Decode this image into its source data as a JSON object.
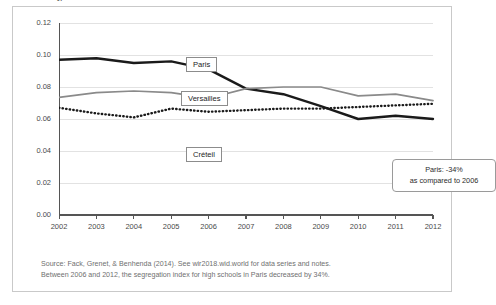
{
  "chart_data": {
    "type": "line",
    "title": "",
    "xlabel": "",
    "ylabel": "Segregation index in high schools",
    "x": [
      2002,
      2003,
      2004,
      2005,
      2006,
      2007,
      2008,
      2009,
      2010,
      2011,
      2012
    ],
    "xtick_labels": [
      "2002",
      "2003",
      "2004",
      "2005",
      "2006",
      "2007",
      "2008",
      "2009",
      "2010",
      "2011",
      "2012"
    ],
    "ytick_labels": [
      "0.00",
      "0.02",
      "0.04",
      "0.06",
      "0.08",
      "0.10",
      "0.12"
    ],
    "ytick_values": [
      0.0,
      0.02,
      0.04,
      0.06,
      0.08,
      0.1,
      0.12
    ],
    "ylim": [
      0.0,
      0.12
    ],
    "xlim": [
      2002,
      2012
    ],
    "grid": "horizontal",
    "legend_position": "inline-callout-boxes",
    "series": [
      {
        "name": "Paris",
        "style": "solid-thick-black",
        "color": "#1a1a1a",
        "values": [
          0.097,
          0.098,
          0.095,
          0.096,
          0.091,
          0.079,
          0.0755,
          0.068,
          0.06,
          0.062,
          0.06
        ]
      },
      {
        "name": "Versailles",
        "style": "solid-gray",
        "color": "#8a8a8a",
        "values": [
          0.0735,
          0.0765,
          0.0775,
          0.0765,
          0.073,
          0.079,
          0.08,
          0.08,
          0.0745,
          0.0755,
          0.0715
        ]
      },
      {
        "name": "Créteil",
        "style": "dotted-black",
        "color": "#1a1a1a",
        "values": [
          0.067,
          0.0635,
          0.061,
          0.0665,
          0.0645,
          0.0655,
          0.0665,
          0.0665,
          0.0675,
          0.0685,
          0.0695
        ]
      }
    ],
    "annotations": [
      {
        "id": "paris-change",
        "line1": "Paris:  -34%",
        "line2": "as compared to 2006"
      }
    ]
  },
  "labels": {
    "paris": "Paris",
    "versailles": "Versailles",
    "creteil": "Créteil"
  },
  "annotation": {
    "line1": "Paris:  -34%",
    "line2": "as compared to 2006"
  },
  "notes": {
    "line1": "Source: Fack, Grenet, & Benhenda (2014). See wir2018.wid.world for data series and notes.",
    "line2": "Between 2006 and 2012, the segregation index for high schools in Paris decreased by 34%."
  },
  "colors": {
    "paris": "#1a1a1a",
    "versailles": "#8a8a8a",
    "creteil": "#1a1a1a",
    "axis": "#555555",
    "grid": "#e2e2e2",
    "border": "#c9c9c9",
    "note_text": "#6f6f6f"
  }
}
